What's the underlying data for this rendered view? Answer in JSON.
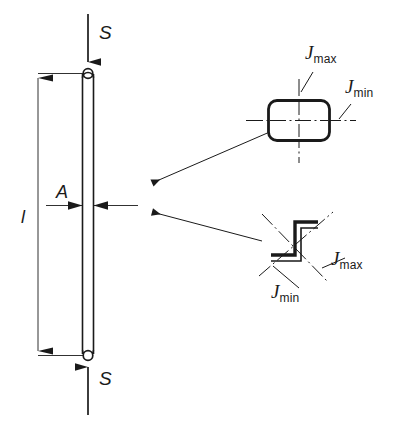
{
  "figure": {
    "type": "engineering-diagram",
    "background_color": "#ffffff",
    "line_color": "#1a1a1a",
    "width": 414,
    "height": 442
  },
  "column": {
    "name": "slender-column",
    "top_force_label": "S",
    "bottom_force_label": "S",
    "length_label": "l",
    "area_label": "A",
    "top_joint": "pin-joint",
    "bottom_joint": "pin-joint",
    "shaft": {
      "x_left": 82,
      "x_right": 94,
      "y_top": 73,
      "y_bottom": 355
    },
    "dimension_line_x": 38
  },
  "sections": [
    {
      "name": "rectangular-hollow-section",
      "shape": "rounded-rectangle",
      "position": "upper",
      "axis_labels": {
        "major": "J",
        "major_sub": "max",
        "minor": "J",
        "minor_sub": "min"
      },
      "bounds": {
        "x": 268,
        "y": 100,
        "width": 62,
        "height": 40
      }
    },
    {
      "name": "z-profile-section",
      "shape": "zee-profile",
      "position": "lower",
      "axis_labels": {
        "major": "J",
        "major_sub": "max",
        "minor": "J",
        "minor_sub": "min"
      },
      "bounds": {
        "x": 262,
        "y": 212,
        "width": 70,
        "height": 72
      }
    }
  ],
  "labels": {
    "force_top": "S",
    "force_bottom": "S",
    "length": "l",
    "area": "A",
    "j_main": "J",
    "j_max_sub": "max",
    "j_min_sub": "min"
  },
  "leaders": [
    {
      "name": "leader-to-rect-section",
      "from": [
        272,
        130
      ],
      "to": [
        148,
        182
      ]
    },
    {
      "name": "leader-to-z-section",
      "from": [
        262,
        240
      ],
      "to": [
        148,
        212
      ]
    }
  ]
}
